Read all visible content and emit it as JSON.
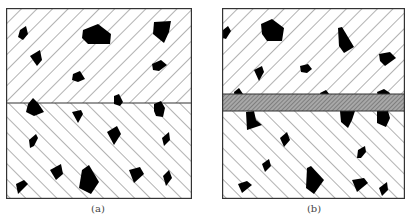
{
  "figure": {
    "panels": [
      {
        "id": "a",
        "label": "(a)",
        "description": "Two hatched layers with embedded particles, separated by a single line interface",
        "upper_hatch": "forward-diagonal",
        "lower_hatch": "backward-diagonal",
        "interface": "line"
      },
      {
        "id": "b",
        "label": "(b)",
        "description": "Two hatched layers with embedded particles, separated by a densely hatched interlayer band",
        "upper_hatch": "forward-diagonal",
        "lower_hatch": "backward-diagonal",
        "interface": "hatched-band"
      }
    ],
    "colors": {
      "border": "#333333",
      "hatch": "#555555",
      "particle": "#000000",
      "band_fill": "#9a9a9a"
    }
  }
}
